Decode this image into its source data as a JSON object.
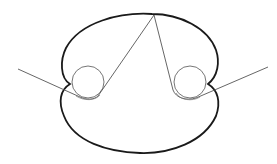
{
  "diagram": {
    "colors": {
      "outline": "#1a1a1a",
      "thin_line": "#555555",
      "background": "#ffffff"
    },
    "circles": [
      {
        "name": "left-circle",
        "cx": 88,
        "cy": 82,
        "r": 16
      },
      {
        "name": "right-circle",
        "cx": 190,
        "cy": 82,
        "r": 16
      }
    ],
    "apex": {
      "x": 154,
      "y": 15
    }
  }
}
